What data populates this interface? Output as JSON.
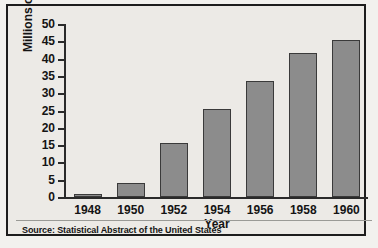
{
  "figure": {
    "background_color": "#eceae6",
    "frame_color": "#1d1d1d",
    "bar_fill_color": "#8c8c8c",
    "bar_edge_color": "#3a3a3a",
    "axis_color": "#2a2a2a"
  },
  "source_note": "Source: Statistical Abstract of the United States",
  "chart_data": {
    "type": "bar",
    "title": "",
    "xlabel": "Year",
    "ylabel": "Millions of homes",
    "categories": [
      "1948",
      "1950",
      "1952",
      "1954",
      "1956",
      "1958",
      "1960"
    ],
    "values": [
      1,
      4,
      15.5,
      25.5,
      33.5,
      41.5,
      45.5
    ],
    "ylim": [
      0,
      50
    ],
    "ytick_labels": [
      "50",
      "45",
      "40",
      "35",
      "30",
      "25",
      "20",
      "15",
      "10",
      "5",
      "0"
    ],
    "ytick_values": [
      50,
      45,
      40,
      35,
      30,
      25,
      20,
      15,
      10,
      5,
      0
    ],
    "ytick_step": 5,
    "grid": false,
    "legend": null
  }
}
